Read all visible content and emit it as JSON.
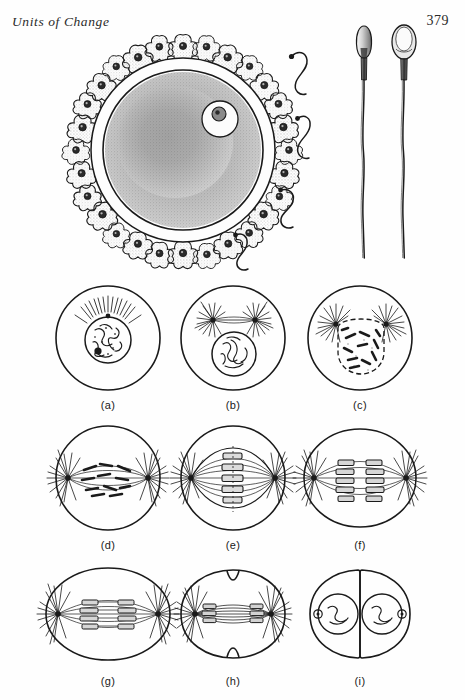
{
  "page": {
    "running_head": "Units of Change",
    "page_number": "379"
  },
  "figures": {
    "ovum": {
      "name": "ovum-with-corona-radiata",
      "description": "Human ovum surrounded by corona radiata follicle cells, with free spermatozoa approaching",
      "parts": {
        "nucleus": "nucleus",
        "nucleolus": "nucleolus",
        "zona_pellucida": "zona pellucida",
        "cytoplasm": "cytoplasm",
        "corona_cells": 28,
        "free_sperm": 4
      }
    },
    "sperm": {
      "name": "spermatozoa-enlarged",
      "views": [
        "side view",
        "face view"
      ],
      "count": 2
    }
  },
  "mitosis": {
    "title": "stages of mitosis",
    "panels": [
      {
        "key": "a",
        "label": "(a)",
        "stage": "early prophase",
        "name": "mitosis-panel-a"
      },
      {
        "key": "b",
        "label": "(b)",
        "stage": "prophase with paired asters",
        "name": "mitosis-panel-b"
      },
      {
        "key": "c",
        "label": "(c)",
        "stage": "late prophase, nuclear membrane dissolving",
        "name": "mitosis-panel-c"
      },
      {
        "key": "d",
        "label": "(d)",
        "stage": "prometaphase, spindle forming",
        "name": "mitosis-panel-d"
      },
      {
        "key": "e",
        "label": "(e)",
        "stage": "metaphase, equatorial plate",
        "name": "mitosis-panel-e"
      },
      {
        "key": "f",
        "label": "(f)",
        "stage": "anaphase, chromatids separating",
        "name": "mitosis-panel-f"
      },
      {
        "key": "g",
        "label": "(g)",
        "stage": "late anaphase, cell elongating",
        "name": "mitosis-panel-g"
      },
      {
        "key": "h",
        "label": "(h)",
        "stage": "telophase, cleavage furrow",
        "name": "mitosis-panel-h"
      },
      {
        "key": "i",
        "label": "(i)",
        "stage": "two daughter cells",
        "name": "mitosis-panel-i"
      }
    ]
  },
  "colors": {
    "ink": "#1a1a1a",
    "paper": "#fefefe",
    "stipple": "#6b6b6b"
  }
}
